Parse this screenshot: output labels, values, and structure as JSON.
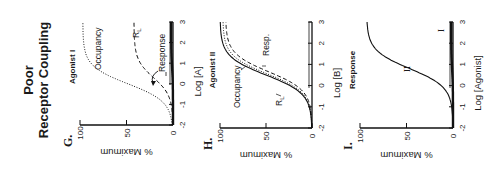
{
  "figure": {
    "title_line1": "Poor",
    "title_line2": "Receptor Coupling",
    "orientation": "rotated 90 degrees counterclockwise"
  },
  "chart_data": [
    {
      "type": "line",
      "panel_label": "G.",
      "title": "Agonist I",
      "xlabel": "Log [A]",
      "ylabel": "% Maximum",
      "xlim": [
        -2,
        3
      ],
      "ylim": [
        0,
        100
      ],
      "xticks": [
        "-2",
        "-1",
        "0",
        "1",
        "2",
        "3"
      ],
      "yticks": [
        "0",
        "50",
        "100"
      ],
      "series": [
        {
          "name": "Occupancy",
          "style": "dotted",
          "ec50_log": 0.0,
          "max": 97,
          "hill": 1.0
        },
        {
          "name": "RL",
          "label_text": "R",
          "label_sub": "L",
          "style": "dashed",
          "ec50_log": 0.3,
          "max": 42,
          "hill": 1.0
        },
        {
          "name": "Response",
          "style": "solid-thick",
          "ec50_log": 0.8,
          "max": 2,
          "hill": 1.0
        }
      ],
      "annotations": [
        "Occupancy",
        "R_L",
        "Response"
      ]
    },
    {
      "type": "line",
      "panel_label": "H.",
      "title": "Agonist II",
      "xlabel": "Log [B]",
      "ylabel": "% Maximum",
      "xlim": [
        -2,
        3
      ],
      "ylim": [
        0,
        100
      ],
      "xticks": [
        "-2",
        "-1",
        "0",
        "1",
        "2",
        "3"
      ],
      "yticks": [
        "0",
        "50",
        "100"
      ],
      "series": [
        {
          "name": "Occupancy",
          "style": "dotted",
          "ec50_log": 0.55,
          "max": 97,
          "hill": 1.0
        },
        {
          "name": "RL",
          "label_text": "R",
          "label_sub": "L",
          "style": "dashed",
          "ec50_log": 0.65,
          "max": 94,
          "hill": 1.0
        },
        {
          "name": "Resp.",
          "style": "solid",
          "ec50_log": 0.5,
          "max": 100,
          "hill": 1.0
        }
      ],
      "annotations": [
        "Occupancy",
        "R_L",
        "Resp."
      ]
    },
    {
      "type": "line",
      "panel_label": "I.",
      "title": "Response",
      "xlabel": "Log [Agonist]",
      "ylabel": "% Maximum",
      "xlim": [
        -2,
        3
      ],
      "ylim": [
        0,
        100
      ],
      "xticks": [
        "-2",
        "-1",
        "0",
        "1",
        "2",
        "3"
      ],
      "yticks": [
        "0",
        "50",
        "100"
      ],
      "series": [
        {
          "name": "II",
          "style": "solid",
          "ec50_log": 0.8,
          "max": 93,
          "hill": 1.0
        },
        {
          "name": "I",
          "style": "solid-thick",
          "ec50_log": 0.8,
          "max": 2,
          "hill": 1.0
        }
      ],
      "annotations": [
        "II",
        "I"
      ]
    }
  ]
}
